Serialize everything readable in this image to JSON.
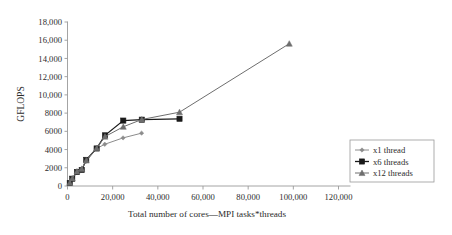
{
  "chart_data": {
    "type": "line",
    "title": "",
    "xlabel": "Total number of cores—MPI tasks*threads",
    "ylabel": "GFLOPS",
    "xlim": [
      0,
      120000
    ],
    "ylim": [
      0,
      18000
    ],
    "grid": false,
    "legend_position": "bottom-right",
    "x_tick_labels": [
      "0",
      "20,000",
      "40,000",
      "60,000",
      "80,000",
      "100,000",
      "120,000"
    ],
    "x_ticks": [
      0,
      20000,
      40000,
      60000,
      80000,
      100000,
      120000
    ],
    "y_tick_labels": [
      "0",
      "2000",
      "4000",
      "6000",
      "8000",
      "10,000",
      "12,000",
      "14,000",
      "16,000",
      "18,000"
    ],
    "y_ticks": [
      0,
      2000,
      4000,
      6000,
      8000,
      10000,
      12000,
      14000,
      16000,
      18000
    ],
    "series": [
      {
        "name": "x1 thread",
        "marker": "diamond",
        "color": "#8c8c8c",
        "points": [
          [
            1000,
            330
          ],
          [
            2000,
            780
          ],
          [
            4100,
            1500
          ],
          [
            6200,
            1780
          ],
          [
            8200,
            2700
          ],
          [
            12800,
            4100
          ],
          [
            16500,
            4580
          ],
          [
            24600,
            5280
          ],
          [
            32800,
            5800
          ]
        ]
      },
      {
        "name": "x6 threads",
        "marker": "square",
        "color": "#1a1a1a",
        "points": [
          [
            1000,
            330
          ],
          [
            2100,
            800
          ],
          [
            4200,
            1530
          ],
          [
            6300,
            1760
          ],
          [
            8300,
            2870
          ],
          [
            12900,
            4120
          ],
          [
            16600,
            5560
          ],
          [
            24700,
            7180
          ],
          [
            32900,
            7280
          ],
          [
            49600,
            7380
          ]
        ]
      },
      {
        "name": "x12 threads",
        "marker": "triangle",
        "color": "#6e6e6e",
        "points": [
          [
            1000,
            350
          ],
          [
            2100,
            830
          ],
          [
            4200,
            1600
          ],
          [
            6300,
            1880
          ],
          [
            8300,
            2800
          ],
          [
            12900,
            4150
          ],
          [
            16600,
            5420
          ],
          [
            24700,
            6500
          ],
          [
            32900,
            7300
          ],
          [
            49600,
            8100
          ],
          [
            98200,
            15620
          ]
        ]
      }
    ]
  },
  "legend": {
    "entries": [
      {
        "label": "x1 thread"
      },
      {
        "label": "x6 threads"
      },
      {
        "label": "x12 threads"
      }
    ]
  },
  "colors": {
    "axis": "#9a9a9a",
    "text": "#2b2b2b",
    "series_x1": "#8c8c8c",
    "series_x6": "#1a1a1a",
    "series_x12": "#6e6e6e",
    "background": "#ffffff"
  }
}
